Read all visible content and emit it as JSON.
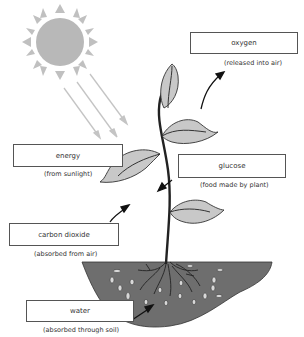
{
  "diagram": {
    "labels": [
      {
        "id": "oxygen",
        "box_text": "oxygen",
        "caption": "(released into air)"
      },
      {
        "id": "energy",
        "box_text": "energy",
        "caption": "(from sunlight)"
      },
      {
        "id": "glucose",
        "box_text": "glucose",
        "caption": "(food made by plant)"
      },
      {
        "id": "carbon_dioxide",
        "box_text": "carbon dioxide",
        "caption": "(absorbed from air)"
      },
      {
        "id": "water",
        "box_text": "water",
        "caption": "(absorbed through soil)"
      }
    ],
    "elements": [
      "sun-icon",
      "sunlight-rays",
      "plant",
      "leaves",
      "roots",
      "soil",
      "water-droplets",
      "arrows"
    ],
    "colors": {
      "sun": "#b8b8b8",
      "leaf": "#c8c8c8",
      "soil": "#6e6e6e",
      "stem": "#222222",
      "ray": "#c4c4c4"
    }
  }
}
